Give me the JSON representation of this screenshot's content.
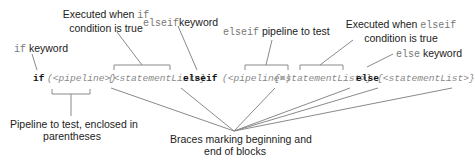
{
  "labels": {
    "if_keyword": {
      "code": "if",
      "text": "keyword"
    },
    "if_true": {
      "line1_text": "Executed when",
      "line1_code": "if",
      "line2": "condition is true"
    },
    "elseif_keyword": {
      "code": "elseif",
      "text": "keyword"
    },
    "elseif_pipeline": {
      "code": "elseif",
      "text": "pipeline to test"
    },
    "elseif_true": {
      "line1_text": "Executed when",
      "line1_code": "elseif",
      "line2": "condition is true"
    },
    "else_keyword": {
      "code": "else",
      "text": "keyword"
    },
    "pipeline": {
      "line1": "Pipeline to test, enclosed in",
      "line2": "parentheses"
    },
    "braces": {
      "line1": "Braces marking beginning and",
      "line2": "end of blocks"
    }
  },
  "code": {
    "if": "if",
    "pipe1": "(<pipeline>)",
    "stmt1": "{<statementList>}",
    "elseif": "elseif",
    "pipe2": "(<pipeline>)",
    "stmt2": "{<statementList>}",
    "else": "else",
    "stmt3": "{<statementList>}"
  }
}
